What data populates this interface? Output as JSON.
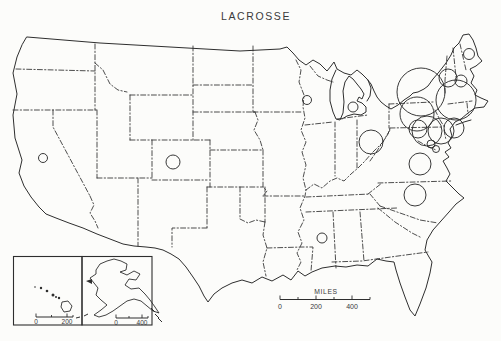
{
  "title": "LACROSSE",
  "colors": {
    "background": "#fcfcfa",
    "line": "#2e2e2e",
    "text": "#3a3a3a"
  },
  "map": {
    "symbols": [
      {
        "region": "california",
        "x": 43,
        "y": 158,
        "r": 4.5
      },
      {
        "region": "colorado",
        "x": 173,
        "y": 162,
        "r": 7
      },
      {
        "region": "wisconsin",
        "x": 307,
        "y": 100,
        "r": 4.5
      },
      {
        "region": "michigan",
        "x": 353,
        "y": 107,
        "r": 5
      },
      {
        "region": "ohio",
        "x": 371,
        "y": 142,
        "r": 12
      },
      {
        "region": "mississippi",
        "x": 322,
        "y": 238,
        "r": 5
      },
      {
        "region": "maine",
        "x": 469,
        "y": 54,
        "r": 5.5
      },
      {
        "region": "vermont-new-hampshire",
        "x": 448,
        "y": 78,
        "r": 9
      },
      {
        "region": "coastal-new-england",
        "x": 461,
        "y": 81,
        "r": 6
      },
      {
        "region": "upstate-new-york",
        "x": 421,
        "y": 92,
        "r": 24
      },
      {
        "region": "southern-new-england",
        "x": 456,
        "y": 100,
        "r": 20
      },
      {
        "region": "central-pennsylvania-new-york",
        "x": 417,
        "y": 114,
        "r": 17
      },
      {
        "region": "philadelphia-area",
        "x": 427,
        "y": 131,
        "r": 15
      },
      {
        "region": "new-jersey-delaware",
        "x": 441,
        "y": 131,
        "r": 13
      },
      {
        "region": "long-island-connecticut",
        "x": 454,
        "y": 128,
        "r": 10
      },
      {
        "region": "baltimore-area",
        "x": 418,
        "y": 129,
        "r": 9
      },
      {
        "region": "washington-dc-area",
        "x": 431,
        "y": 144,
        "r": 4
      },
      {
        "region": "southern-maryland",
        "x": 436,
        "y": 149,
        "r": 3.5
      },
      {
        "region": "virginia",
        "x": 420,
        "y": 164,
        "r": 11
      },
      {
        "region": "north-carolina",
        "x": 415,
        "y": 195,
        "r": 11
      }
    ]
  },
  "scale_bar": {
    "label": "MILES",
    "tick_labels": [
      "0",
      "200",
      "400"
    ]
  },
  "insets": {
    "hawaii": {
      "tick_labels": [
        "0",
        "200"
      ]
    },
    "alaska": {
      "tick_labels": [
        "0",
        "400"
      ]
    }
  }
}
